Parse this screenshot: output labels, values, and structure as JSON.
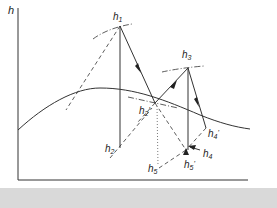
{
  "diagram": {
    "type": "enthalpy-entropy (h-S) diagram",
    "axes": {
      "y_label": "h",
      "x_label": "S"
    },
    "points": {
      "h1": {
        "label": "h",
        "sub": "1"
      },
      "h2": {
        "label": "h",
        "sub": "2"
      },
      "h2p": {
        "label": "h",
        "sub": "2",
        "prime": "'"
      },
      "h3": {
        "label": "h",
        "sub": "3"
      },
      "h4": {
        "label": "h",
        "sub": "4"
      },
      "h4p": {
        "label": "h",
        "sub": "4",
        "prime": "'"
      },
      "h5": {
        "label": "h",
        "sub": "5"
      },
      "h5p": {
        "label": "h",
        "sub": "5",
        "prime": "'"
      }
    },
    "colors": {
      "line": "#333333",
      "background": "#ffffff",
      "strip": "#d9d9d9"
    }
  }
}
